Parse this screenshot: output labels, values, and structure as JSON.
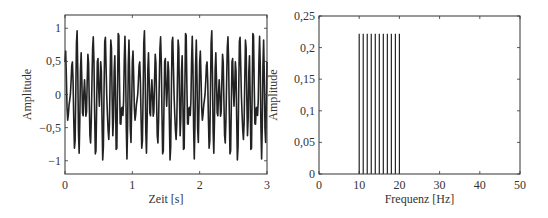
{
  "chart_data": [
    {
      "type": "line",
      "title": "",
      "xlabel": "Zeit [s]",
      "ylabel": "Amplitude",
      "xlim": [
        0,
        3
      ],
      "ylim": [
        -1.2,
        1.2
      ],
      "xticks": [
        0,
        1,
        2,
        3
      ],
      "xtick_labels": [
        "0",
        "1",
        "2",
        "3"
      ],
      "yticks": [
        -1,
        -0.5,
        0,
        0.5,
        1
      ],
      "ytick_labels": [
        "−1",
        "−0,5",
        "0",
        "0,5",
        "1"
      ],
      "grid": false,
      "legend": null,
      "description": "Sum of 11 sinusoids (10..20 Hz, amplitude 2/9 each), periodic with period 1 s; peaks near ±1",
      "series": [
        {
          "name": "signal",
          "color": "#222222",
          "components_hz": [
            10,
            11,
            12,
            13,
            14,
            15,
            16,
            17,
            18,
            19,
            20
          ],
          "component_amplitude": 0.2222,
          "sample_rate_hz": 100
        }
      ]
    },
    {
      "type": "bar",
      "title": "",
      "xlabel": "Frequenz [Hz]",
      "ylabel": "Amplitude",
      "xlim": [
        0,
        50
      ],
      "ylim": [
        0,
        0.25
      ],
      "xticks": [
        0,
        10,
        20,
        30,
        40,
        50
      ],
      "xtick_labels": [
        "0",
        "10",
        "20",
        "30",
        "40",
        "50"
      ],
      "yticks": [
        0,
        0.05,
        0.1,
        0.15,
        0.2,
        0.25
      ],
      "ytick_labels": [
        "0",
        "0,05",
        "0,1",
        "0,15",
        "0,2",
        "0,25"
      ],
      "grid": false,
      "legend": null,
      "categories": [
        10,
        11,
        12,
        13,
        14,
        15,
        16,
        17,
        18,
        19,
        20
      ],
      "values": [
        0.222,
        0.222,
        0.222,
        0.222,
        0.222,
        0.222,
        0.222,
        0.222,
        0.222,
        0.222,
        0.222
      ],
      "series": [
        {
          "name": "spectrum",
          "color": "#222222",
          "x": [
            10,
            11,
            12,
            13,
            14,
            15,
            16,
            17,
            18,
            19,
            20
          ],
          "values": [
            0.222,
            0.222,
            0.222,
            0.222,
            0.222,
            0.222,
            0.222,
            0.222,
            0.222,
            0.222,
            0.222
          ]
        }
      ]
    }
  ],
  "layout": {
    "plots": [
      {
        "left": 65,
        "top": 15,
        "right": 267,
        "bottom": 174
      },
      {
        "left": 319,
        "top": 16,
        "right": 520,
        "bottom": 174
      }
    ]
  }
}
